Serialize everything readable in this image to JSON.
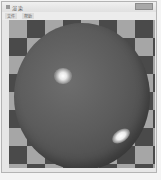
{
  "window": {
    "title": "渲染",
    "close_button": "close"
  },
  "menubar": {
    "items": [
      {
        "label": "文件"
      },
      {
        "label": "帮助"
      }
    ]
  },
  "canvas": {
    "scene": "reflective-sphere-over-checkerboard",
    "checker_colors": {
      "dark": "#4a4a4a",
      "light": "#a6a6a6"
    },
    "sphere_color": "#5c5c5c",
    "highlight_color": "#ffffff"
  }
}
